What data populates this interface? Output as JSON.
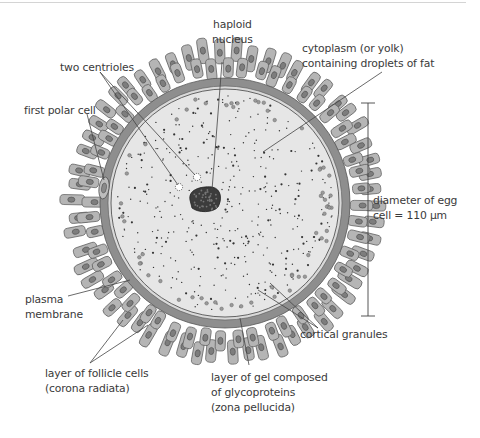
{
  "diagram": {
    "labels": {
      "haploid_nucleus": [
        "haploid",
        "nucleus"
      ],
      "cytoplasm": [
        "cytoplasm (or yolk)",
        "containing droplets of fat"
      ],
      "two_centrioles": [
        "two centrioles"
      ],
      "first_polar_cell": [
        "first polar cell"
      ],
      "diameter": [
        "diameter of egg",
        "cell = 110 µm"
      ],
      "plasma_membrane": [
        "plasma",
        "membrane"
      ],
      "cortical_granules": [
        "cortical granules"
      ],
      "follicle_cells": [
        "layer of follicle cells",
        "(corona radiata)"
      ],
      "zona_pellucida": [
        "layer of gel composed",
        "of glycoproteins",
        "(zona pellucida)"
      ]
    },
    "colors": {
      "background": "#ffffff",
      "cytoplasm": "#e6e6e6",
      "zona_pellucida": "#8e8e8e",
      "follicle_cell": "#b5b5b5",
      "follicle_outline": "#5a5a5a",
      "follicle_nucleus": "#7d7d7d",
      "nucleus": "#3c3c3c",
      "leader_line": "#444444",
      "text": "#3a3a3a"
    },
    "measurement": {
      "value": "110",
      "unit": "µm"
    }
  }
}
